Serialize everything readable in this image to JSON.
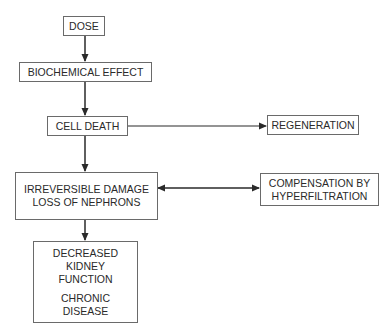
{
  "diagram": {
    "nodes": {
      "dose": {
        "lines": [
          "DOSE"
        ]
      },
      "biochemical": {
        "lines": [
          "BIOCHEMICAL EFFECT"
        ]
      },
      "cell_death": {
        "lines": [
          "CELL DEATH"
        ]
      },
      "regeneration": {
        "lines": [
          "REGENERATION"
        ]
      },
      "irreversible": {
        "lines": [
          "IRREVERSIBLE DAMAGE",
          "LOSS OF NEPHRONS"
        ]
      },
      "compensation": {
        "lines": [
          "COMPENSATION BY",
          "HYPERFILTRATION"
        ]
      },
      "decreased": {
        "lines": [
          "DECREASED",
          "KIDNEY",
          "FUNCTION"
        ],
        "lines2": [
          "CHRONIC",
          "DISEASE"
        ]
      }
    },
    "edges": [
      {
        "from": "dose",
        "to": "biochemical",
        "type": "arrow"
      },
      {
        "from": "biochemical",
        "to": "cell_death",
        "type": "arrow"
      },
      {
        "from": "cell_death",
        "to": "regeneration",
        "type": "arrow"
      },
      {
        "from": "cell_death",
        "to": "irreversible",
        "type": "arrow"
      },
      {
        "from": "irreversible",
        "to": "compensation",
        "type": "double-arrow"
      },
      {
        "from": "irreversible",
        "to": "decreased",
        "type": "arrow"
      }
    ],
    "colors": {
      "line": "#2a2a2a",
      "border": "#6a6a6a",
      "text": "#2a2a2a",
      "background": "#ffffff"
    }
  }
}
